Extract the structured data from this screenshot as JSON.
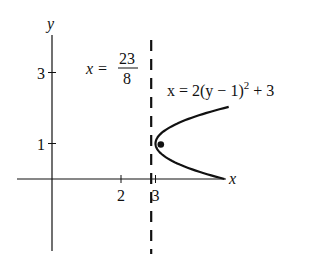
{
  "diagram": {
    "axes": {
      "x_label": "x",
      "y_label": "y",
      "x_ticks": [
        {
          "value": 2,
          "label": "2"
        },
        {
          "value": 3,
          "label": "3"
        }
      ],
      "y_ticks": [
        {
          "value": 1,
          "label": "1"
        },
        {
          "value": 3,
          "label": "3"
        }
      ]
    },
    "directrix": {
      "value": 2.875,
      "label_lhs": "x =",
      "label_num": "23",
      "label_den": "8",
      "style": "dashed"
    },
    "parabola": {
      "equation_prefix": "x = 2(y − 1)",
      "equation_exp": "2",
      "equation_suffix": " + 3",
      "vertex": [
        3,
        1
      ],
      "y_range": [
        0,
        2.03
      ]
    },
    "focus": {
      "point": [
        3.125,
        1
      ]
    },
    "colors": {
      "ink": "#111111",
      "background": "#ffffff"
    }
  }
}
